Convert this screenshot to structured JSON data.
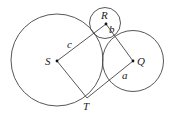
{
  "diagram": {
    "colors": {
      "stroke": "#444444",
      "text": "#222222",
      "point": "#111111"
    },
    "circles": [
      {
        "name": "circle-S",
        "cx": 57,
        "cy": 60,
        "r": 46
      },
      {
        "name": "circle-R",
        "cx": 105,
        "cy": 23,
        "r": 15.5
      },
      {
        "name": "circle-Q",
        "cx": 133,
        "cy": 61,
        "r": 30.5
      }
    ],
    "points": {
      "S": {
        "label": "S",
        "x": 57,
        "y": 61
      },
      "R": {
        "label": "R",
        "x": 106,
        "y": 24
      },
      "Q": {
        "label": "Q",
        "x": 133,
        "y": 61
      },
      "T": {
        "label": "T",
        "x": 87,
        "y": 98
      }
    },
    "segments": [
      {
        "from": "S",
        "to": "R",
        "label": "c"
      },
      {
        "from": "R",
        "to": "Q",
        "label": "b"
      },
      {
        "from": "Q",
        "to": "T",
        "label": "a"
      },
      {
        "from": "T",
        "to": "S",
        "label": ""
      }
    ],
    "labels": {
      "S": "S",
      "R": "R",
      "Q": "Q",
      "T": "T",
      "a": "a",
      "b": "b",
      "c": "c"
    }
  }
}
